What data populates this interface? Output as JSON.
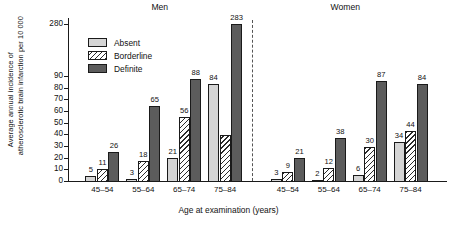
{
  "chart_data": {
    "type": "bar",
    "title": "",
    "xlabel": "Age at examination (years)",
    "ylabel_line1": "Average annual incidence of",
    "ylabel_line2": "atherosclerotic brain infarction per 10 000",
    "grid": false,
    "legend_position": "upper-left-inside",
    "y_ticks": [
      0,
      10,
      20,
      30,
      40,
      50,
      60,
      70,
      80,
      90,
      280
    ],
    "y_axis_break": true,
    "ylim": [
      0,
      280
    ],
    "categories": [
      "45–54",
      "55–64",
      "65–74",
      "75–84"
    ],
    "panels": [
      {
        "name": "Men",
        "series": [
          {
            "name": "Absent",
            "values": [
              5,
              3,
              21,
              84
            ]
          },
          {
            "name": "Borderline",
            "values": [
              11,
              18,
              56,
              40
            ]
          },
          {
            "name": "Definite",
            "values": [
              26,
              65,
              88,
              283
            ]
          }
        ],
        "value_labels": [
          [
            "5",
            "3",
            "21",
            "84"
          ],
          [
            "11",
            "18",
            "56",
            ""
          ],
          [
            "26",
            "65",
            "88",
            "283"
          ]
        ]
      },
      {
        "name": "Women",
        "series": [
          {
            "name": "Absent",
            "values": [
              3,
              2,
              6,
              34
            ]
          },
          {
            "name": "Borderline",
            "values": [
              9,
              12,
              30,
              44
            ]
          },
          {
            "name": "Definite",
            "values": [
              21,
              38,
              87,
              84
            ]
          }
        ],
        "value_labels": [
          [
            "3",
            "2",
            "6",
            "34"
          ],
          [
            "9",
            "12",
            "30",
            "44"
          ],
          [
            "21",
            "38",
            "87",
            "84"
          ]
        ]
      }
    ],
    "legend": [
      {
        "label": "Absent",
        "pattern": "solid-light",
        "color": "#d5d5d5"
      },
      {
        "label": "Borderline",
        "pattern": "diagonal-hatch",
        "color": "#ffffff"
      },
      {
        "label": "Definite",
        "pattern": "solid-dark",
        "color": "#5c5c5c"
      }
    ]
  }
}
